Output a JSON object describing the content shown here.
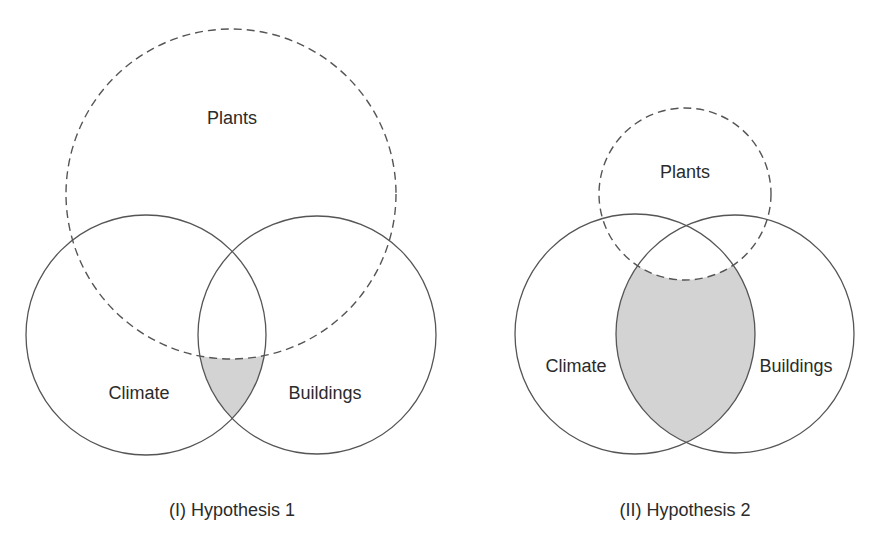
{
  "colors": {
    "stroke": "#555555",
    "shade": "#d3d3d3",
    "text": "#2b2b2b",
    "background": "#ffffff"
  },
  "diagrams": [
    {
      "caption": "(I) Hypothesis 1",
      "sets": [
        {
          "label": "Plants",
          "style": "dashed"
        },
        {
          "label": "Climate",
          "style": "solid"
        },
        {
          "label": "Buildings",
          "style": "solid"
        }
      ],
      "shaded_region": "Plants ∩ Climate ∩ Buildings (outside Plants, inside Climate ∩ Buildings)"
    },
    {
      "caption": "(II) Hypothesis 2",
      "sets": [
        {
          "label": "Plants",
          "style": "dashed"
        },
        {
          "label": "Climate",
          "style": "solid"
        },
        {
          "label": "Buildings",
          "style": "solid"
        }
      ],
      "shaded_region": "Climate ∩ Buildings outside Plants"
    }
  ]
}
